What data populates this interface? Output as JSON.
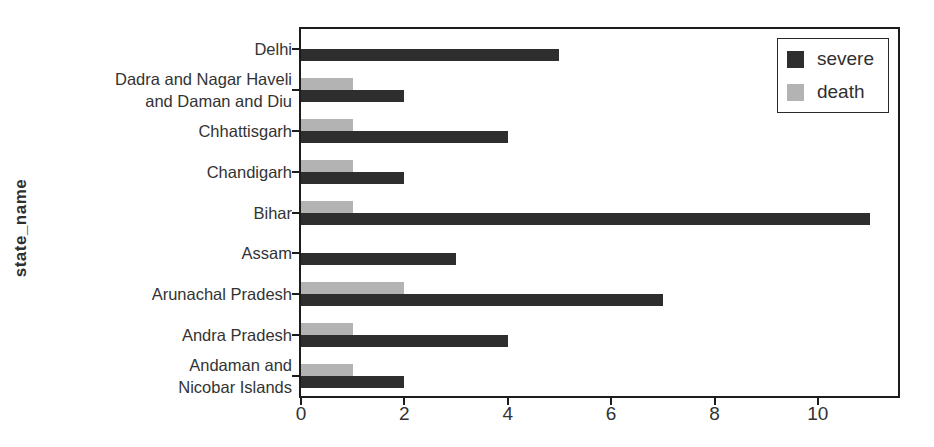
{
  "chart_data": {
    "type": "bar",
    "orientation": "horizontal",
    "title": "",
    "xlabel": "",
    "ylabel": "state_name",
    "grid": false,
    "categories": [
      {
        "label": "Delhi",
        "lines": [
          "Delhi"
        ]
      },
      {
        "label": "Dadra and Nagar Haveli and Daman and Diu",
        "lines": [
          "Dadra and Nagar Haveli",
          "and Daman and Diu"
        ]
      },
      {
        "label": "Chhattisgarh",
        "lines": [
          "Chhattisgarh"
        ]
      },
      {
        "label": "Chandigarh",
        "lines": [
          "Chandigarh"
        ]
      },
      {
        "label": "Bihar",
        "lines": [
          "Bihar"
        ]
      },
      {
        "label": "Assam",
        "lines": [
          "Assam"
        ]
      },
      {
        "label": "Arunachal Pradesh",
        "lines": [
          "Arunachal Pradesh"
        ]
      },
      {
        "label": "Andra Pradesh",
        "lines": [
          "Andra Pradesh"
        ]
      },
      {
        "label": "Andaman and Nicobar Islands",
        "lines": [
          "Andaman and",
          "Nicobar Islands"
        ]
      }
    ],
    "series": [
      {
        "name": "severe",
        "color": "#2e2e2e",
        "values": [
          5,
          2,
          4,
          2,
          11,
          3,
          7,
          4,
          2
        ]
      },
      {
        "name": "death",
        "color": "#b3b3b3",
        "values": [
          0,
          1,
          1,
          1,
          1,
          0,
          2,
          1,
          1
        ]
      }
    ],
    "xticks": [
      0,
      2,
      4,
      6,
      8,
      10
    ],
    "xlim": [
      0,
      11.55
    ],
    "legend": {
      "position": "top-right",
      "entries": [
        "severe",
        "death"
      ]
    }
  }
}
